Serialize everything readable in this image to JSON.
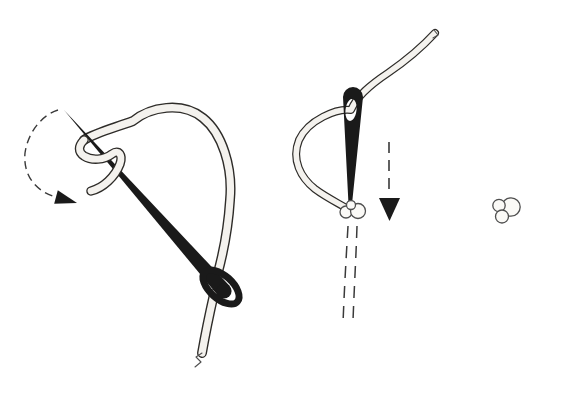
{
  "figure": {
    "type": "illustration",
    "colors": {
      "paper": "#ffffff",
      "ink": "#1a1a1a",
      "thread_outline": "#2e2c29",
      "thread_fill": "#f4f2ee",
      "guide": "#3a3a3a",
      "knot_outline": "#4f4f4f",
      "knot_fill": "#fbfaf7"
    },
    "panels": [
      {
        "name": "wrap-thread-around-needle",
        "parts": [
          "needle",
          "thread-big-loop",
          "thread-wrap",
          "thread-tail",
          "rotation-arrow"
        ]
      },
      {
        "name": "pull-needle-down-through-wraps",
        "parts": [
          "needle",
          "thread-through-eye",
          "forming-knot",
          "pull-down-arrow",
          "pull-path-guides"
        ]
      },
      {
        "name": "finished-knot",
        "parts": [
          "knot"
        ]
      }
    ]
  }
}
